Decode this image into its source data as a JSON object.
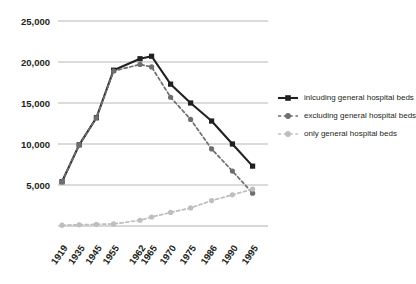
{
  "chart_data": {
    "type": "line",
    "title": "",
    "subtitle": "",
    "xlabel": "",
    "ylabel": "",
    "x": [
      "1919",
      "1935",
      "1945",
      "1955",
      "1962",
      "1965",
      "1970",
      "1975",
      "1986",
      "1990",
      "1995"
    ],
    "categories": [
      "1919",
      "1935",
      "1945",
      "1955",
      "1962",
      "1965",
      "1970",
      "1975",
      "1986",
      "1990",
      "1995"
    ],
    "ylim": [
      0,
      25000
    ],
    "xlim": [
      0,
      10
    ],
    "ytick_labels": [
      "5,000",
      "10,000",
      "15,000",
      "20,000",
      "25,000"
    ],
    "ytick_values": [
      5000,
      10000,
      15000,
      20000,
      25000
    ],
    "grid": true,
    "legend_position": "right",
    "series": [
      {
        "name": "inlcuding general hospital beds",
        "color": "#231f20",
        "style": "solid",
        "marker": "square",
        "values": [
          5400,
          9900,
          13200,
          19000,
          20400,
          20700,
          17300,
          15000,
          12800,
          10000,
          7300
        ]
      },
      {
        "name": "excluding general hospital beds",
        "color": "#6d6e71",
        "style": "dashed",
        "marker": "circle",
        "values": [
          5400,
          9900,
          13200,
          18900,
          19700,
          19400,
          15700,
          13000,
          9400,
          6700,
          4000
        ]
      },
      {
        "name": "only general hospital beds",
        "color": "#bcbec0",
        "style": "dashed",
        "marker": "circle",
        "values": [
          100,
          150,
          200,
          250,
          700,
          1100,
          1650,
          2200,
          3100,
          3800,
          4500
        ]
      }
    ]
  },
  "legend": {
    "entries": [
      {
        "label": "inlcuding general hospital beds",
        "color": "#231f20",
        "marker": "square-solid-line"
      },
      {
        "label": "excluding general hospital beds",
        "color": "#6d6e71",
        "marker": "circle-dashed-line"
      },
      {
        "label": "only general hospital beds",
        "color": "#bcbec0",
        "marker": "circle-dashed-line"
      }
    ]
  },
  "axes": {
    "y_ticks": [
      "5,000",
      "10,000",
      "15,000",
      "20,000",
      "25,000"
    ],
    "x_ticks": [
      "1919",
      "1935",
      "1945",
      "1955",
      "1962",
      "1965",
      "1970",
      "1975",
      "1986",
      "1990",
      "1995"
    ]
  }
}
